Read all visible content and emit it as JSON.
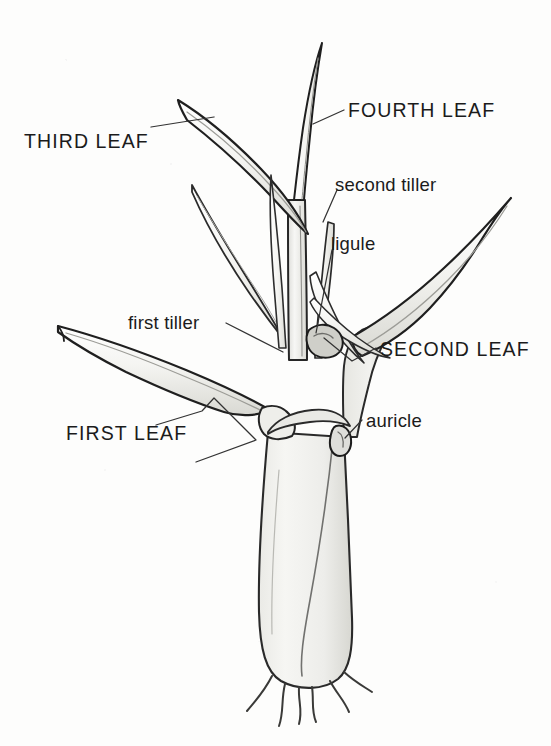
{
  "figure": {
    "background_color": "#fdfdfc",
    "ink_color": "#1b1b1b",
    "fill_light": "#f2f2ef",
    "fill_mid": "#e2e2dd",
    "width": 551,
    "height": 746
  },
  "labels": [
    {
      "id": "third-leaf",
      "text": "THIRD LEAF",
      "style": "caps",
      "x": 24,
      "y": 132
    },
    {
      "id": "fourth-leaf",
      "text": "FOURTH LEAF",
      "style": "caps",
      "x": 348,
      "y": 101
    },
    {
      "id": "second-tiller",
      "text": "second tiller",
      "style": "lower",
      "x": 335,
      "y": 176
    },
    {
      "id": "ligule",
      "text": "ligule",
      "style": "lower",
      "x": 331,
      "y": 235
    },
    {
      "id": "first-tiller",
      "text": "first tiller",
      "style": "lower",
      "x": 128,
      "y": 314
    },
    {
      "id": "second-leaf",
      "text": "SECOND LEAF",
      "style": "caps",
      "x": 380,
      "y": 340
    },
    {
      "id": "auricle",
      "text": "auricle",
      "style": "lower",
      "x": 366,
      "y": 412
    },
    {
      "id": "first-leaf",
      "text": "FIRST LEAF",
      "style": "caps",
      "x": 66,
      "y": 424
    }
  ],
  "parts": [
    {
      "id": "fourth-leaf-blade",
      "name": "fourth leaf blade",
      "note": "slender erect blade at top centre"
    },
    {
      "id": "third-leaf-blade",
      "name": "third leaf blade",
      "note": "blade arching up and to the left"
    },
    {
      "id": "second-leaf-blade",
      "name": "second leaf blade",
      "note": "broad blade extending up to the right"
    },
    {
      "id": "first-leaf-blade",
      "name": "first leaf blade",
      "note": "blade extending out to the left"
    },
    {
      "id": "first-tiller-shoot",
      "name": "first tiller",
      "note": "young shoot in left axil"
    },
    {
      "id": "second-tiller-shoot",
      "name": "second tiller",
      "note": "young shoot in right axil"
    },
    {
      "id": "ligule-part",
      "name": "ligule",
      "note": "membrane at sheath/blade junction"
    },
    {
      "id": "auricle-part",
      "name": "auricle",
      "note": "small claw-like lobe at collar"
    },
    {
      "id": "main-sheath",
      "name": "main leaf sheath",
      "note": "swollen sheath forming the base"
    },
    {
      "id": "culm",
      "name": "central culm",
      "note": "vertical stem inside the sheaths"
    },
    {
      "id": "roots",
      "name": "seminal roots",
      "count": 6
    }
  ]
}
